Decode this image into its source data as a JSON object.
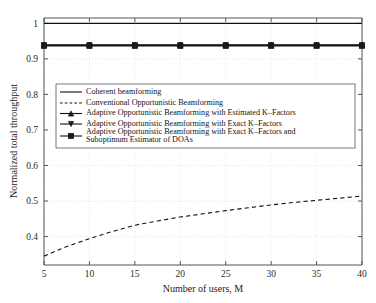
{
  "chart_data": {
    "type": "line",
    "title": "",
    "xlabel": "Number of users, M",
    "ylabel": "Normalized total throughput",
    "xlim": [
      5,
      40
    ],
    "ylim": [
      0.32,
      1.015
    ],
    "xticks": [
      5,
      10,
      15,
      20,
      25,
      30,
      35,
      40
    ],
    "xticklabels": [
      "5",
      "10",
      "15",
      "20",
      "25",
      "30",
      "35",
      "40"
    ],
    "yticks": [
      0.4,
      0.5,
      0.6,
      0.7,
      0.8,
      0.9,
      1
    ],
    "yticklabels": [
      "0.4",
      "0.5",
      "0.6",
      "0.7",
      "0.8",
      "0.9",
      "1"
    ],
    "grid": true,
    "legend_position": "center-left",
    "x": [
      5,
      7.5,
      10,
      12.5,
      15,
      17.5,
      20,
      22.5,
      25,
      27.5,
      30,
      32.5,
      35,
      37.5,
      40
    ],
    "series": [
      {
        "name": "Coherent beamforming",
        "style": "solid",
        "marker": "none",
        "values": [
          1,
          1,
          1,
          1,
          1,
          1,
          1,
          1,
          1,
          1,
          1,
          1,
          1,
          1,
          1
        ]
      },
      {
        "name": "Conventional Opportunistic Beamforming",
        "style": "dashed",
        "marker": "none",
        "values": [
          0.345,
          0.372,
          0.394,
          0.414,
          0.432,
          0.444,
          0.455,
          0.464,
          0.473,
          0.481,
          0.489,
          0.496,
          0.502,
          0.508,
          0.514
        ]
      },
      {
        "name": "Adaptive Opportunistic Beamforming with Estimated K–Factors",
        "style": "solid",
        "marker": "triangle-up",
        "values": [
          0.9395,
          0.9395,
          0.9395,
          0.9395,
          0.9395,
          0.9395,
          0.9395,
          0.9395,
          0.9395,
          0.9395,
          0.9395,
          0.9395,
          0.9395,
          0.9395,
          0.9395
        ]
      },
      {
        "name": "Adaptive Opportunistic Beamforming with Exact K–Factors",
        "style": "solid",
        "marker": "triangle-down",
        "values": [
          0.9385,
          0.9385,
          0.9385,
          0.9385,
          0.9385,
          0.9385,
          0.9385,
          0.9385,
          0.9385,
          0.9385,
          0.9385,
          0.9385,
          0.9385,
          0.9385,
          0.9385
        ]
      },
      {
        "name": "Adaptive Opportunistic Beamforming with Exact K–Factors and Suboptimum Estimator of DOAs",
        "style": "solid",
        "marker": "square",
        "values": [
          0.9365,
          0.9365,
          0.9365,
          0.9365,
          0.9365,
          0.9365,
          0.9365,
          0.9365,
          0.9365,
          0.9365,
          0.9365,
          0.9365,
          0.9365,
          0.9365,
          0.9365
        ]
      }
    ],
    "marker_x": [
      5,
      10,
      15,
      20,
      25,
      30,
      35,
      40
    ]
  },
  "legend": {
    "entries": [
      {
        "label": "Coherent beamforming",
        "label2": "",
        "sample": "solid-line"
      },
      {
        "label": "Conventional Opportunistic Beamforming",
        "label2": "",
        "sample": "dashed-line"
      },
      {
        "label": "Adaptive Opportunistic Beamforming with Estimated K–Factors",
        "label2": "",
        "sample": "triangle-up-line"
      },
      {
        "label": "Adaptive Opportunistic Beamforming with Exact K–Factors",
        "label2": "",
        "sample": "triangle-down-line"
      },
      {
        "label": "Adaptive Opportunistic Beamforming with Exact K–Factors and",
        "label2": "Suboptimum Estimator of DOAs",
        "sample": "square-line"
      }
    ]
  },
  "colors": {
    "line": "#111111",
    "grid": "#c9c9c9",
    "axis": "#555555",
    "background": "#ffffff"
  }
}
